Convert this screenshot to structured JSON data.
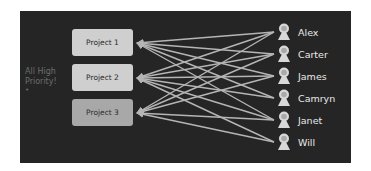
{
  "colors": {
    "panel_bg": "#252525",
    "project_light": "#cfcfcf",
    "project_dark": "#a8a8a8",
    "link_color": "#b5b5b5",
    "person_icon": "#d8d8d8",
    "person_name": "#e9e9e9",
    "side_note": "#6d6d6d"
  },
  "side_note": {
    "line1": "All High",
    "line2": "Priority!",
    "bullet": "•"
  },
  "projects": [
    {
      "label": "Project 1",
      "y": 29,
      "fill": "#cfcfcf"
    },
    {
      "label": "Project 2",
      "y": 64,
      "fill": "#cfcfcf"
    },
    {
      "label": "Project 3",
      "y": 99,
      "fill": "#a8a8a8"
    }
  ],
  "people": [
    {
      "name": "Alex",
      "y": 23
    },
    {
      "name": "Carter",
      "y": 45
    },
    {
      "name": "James",
      "y": 67
    },
    {
      "name": "Camryn",
      "y": 89
    },
    {
      "name": "Janet",
      "y": 111
    },
    {
      "name": "Will",
      "y": 133
    }
  ],
  "links": [
    {
      "from": "Alex",
      "to": "Project 1"
    },
    {
      "from": "Alex",
      "to": "Project 2"
    },
    {
      "from": "Alex",
      "to": "Project 3"
    },
    {
      "from": "Carter",
      "to": "Project 1"
    },
    {
      "from": "Carter",
      "to": "Project 2"
    },
    {
      "from": "Carter",
      "to": "Project 3"
    },
    {
      "from": "James",
      "to": "Project 1"
    },
    {
      "from": "James",
      "to": "Project 2"
    },
    {
      "from": "James",
      "to": "Project 3"
    },
    {
      "from": "Camryn",
      "to": "Project 1"
    },
    {
      "from": "Camryn",
      "to": "Project 2"
    },
    {
      "from": "Janet",
      "to": "Project 1"
    },
    {
      "from": "Janet",
      "to": "Project 2"
    },
    {
      "from": "Janet",
      "to": "Project 3"
    },
    {
      "from": "Will",
      "to": "Project 2"
    },
    {
      "from": "Will",
      "to": "Project 3"
    }
  ]
}
